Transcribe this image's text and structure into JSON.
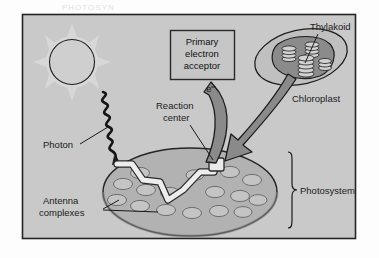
{
  "figure": {
    "frame": {
      "background_color": "#c9c9c9",
      "border_color": "#222222"
    },
    "scan_artifact_text": "PHOTOSYN"
  },
  "labels": {
    "primary_electron_acceptor": {
      "line1": "Primary",
      "line2": "electron",
      "line3": "acceptor"
    },
    "thylakoid": "Thylakoid",
    "chloroplast": "Chloroplast",
    "reaction_center": {
      "line1": "Reaction",
      "line2": "center"
    },
    "photon": "Photon",
    "antenna_complexes": {
      "line1": "Antenna",
      "line2": "complexes"
    },
    "photosystem": "Photosystem",
    "electron": "e"
  },
  "colors": {
    "panel_background": "#c9c9c9",
    "disc_fill": "#b0b0b0",
    "disc_stroke": "#2b2b2b",
    "antenna_fill": "#c2c2c2",
    "antenna_stroke": "#5a5a5a",
    "arrow_fill": "#808080",
    "arrow_stroke": "#1c1c1c",
    "box_fill": "#c4c4c4",
    "box_stroke": "#2a2a2a",
    "chloroplast_fill": "#bdbdbd",
    "chloroplast_inner": "#8f8f8f",
    "grana_fill": "#d0d0d0",
    "energy_path_fill": "#ececec",
    "photon_stroke": "#151515",
    "sun_ray_fill": "#d6d6d6",
    "leader_stroke": "#1a1a1a"
  },
  "elements": {
    "sun": "sun-circle",
    "sun_rays_count": 8,
    "photon_wave": "zigzag-wave",
    "energy_transfer_path": "white-zigzag-path",
    "antenna_complex_count": 16,
    "grana_stack_count": 4,
    "big_arrow": "chloroplast-to-photosystem-arrow",
    "electron_arrow": "curved-electron-arrow",
    "photosystem_bracket": "right-brace-bracket"
  }
}
